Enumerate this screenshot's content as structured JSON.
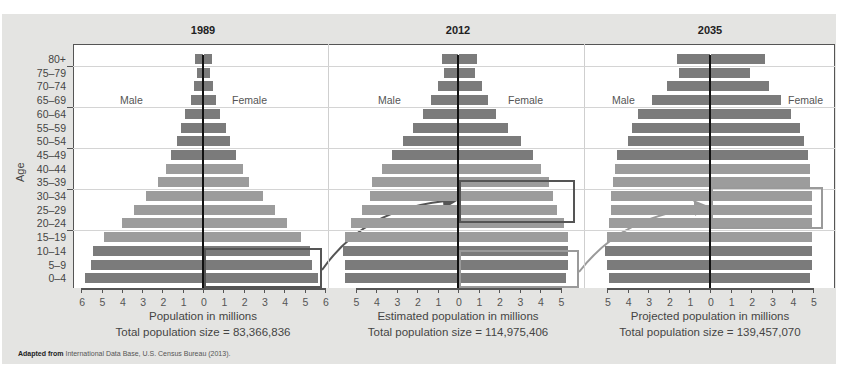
{
  "source": {
    "bold": "Adapted from",
    "text": " International Data Base, U.S. Census Bureau (2013)."
  },
  "y_axis_title": "Age",
  "age_groups": [
    "80+",
    "75–79",
    "70–74",
    "65–69",
    "60–64",
    "55–59",
    "50–54",
    "45–49",
    "40–44",
    "35–39",
    "30–34",
    "25–29",
    "20–24",
    "15–19",
    "10–14",
    "5–9",
    "0–4"
  ],
  "chart_data": [
    {
      "type": "bar",
      "subtype": "population-pyramid",
      "title": "1989",
      "xlabel": "Population in millions",
      "caption": "Total population size = 83,366,836",
      "male_label": "Male",
      "female_label": "Female",
      "ylabel": "Age",
      "xticks": [
        6,
        5,
        4,
        3,
        2,
        1,
        0,
        1,
        2,
        3,
        4,
        5,
        6
      ],
      "xlim": [
        -6,
        6
      ],
      "categories": [
        "80+",
        "75–79",
        "70–74",
        "65–69",
        "60–64",
        "55–59",
        "50–54",
        "45–49",
        "40–44",
        "35–39",
        "30–34",
        "25–29",
        "20–24",
        "15–19",
        "10–14",
        "5–9",
        "0–4"
      ],
      "series": [
        {
          "name": "Male",
          "values": [
            0.4,
            0.3,
            0.45,
            0.6,
            0.9,
            1.1,
            1.3,
            1.6,
            1.8,
            2.2,
            2.8,
            3.4,
            4.0,
            4.9,
            5.4,
            5.5,
            5.8
          ]
        },
        {
          "name": "Female",
          "values": [
            0.4,
            0.3,
            0.45,
            0.6,
            0.8,
            1.1,
            1.3,
            1.6,
            1.9,
            2.2,
            2.9,
            3.5,
            4.1,
            4.8,
            5.2,
            5.3,
            5.6
          ]
        }
      ],
      "shade": [
        "dark",
        "dark",
        "dark",
        "dark",
        "dark",
        "dark",
        "dark",
        "dark",
        "light",
        "light",
        "light",
        "light",
        "light",
        "light",
        "dark",
        "dark",
        "dark"
      ],
      "highlight_box": {
        "ages": [
          "10–14",
          "5–9",
          "0–4"
        ],
        "side": "female"
      }
    },
    {
      "type": "bar",
      "subtype": "population-pyramid",
      "title": "2012",
      "xlabel": "Estimated population in millions",
      "caption": "Total population size = 114,975,406",
      "male_label": "Male",
      "female_label": "Female",
      "ylabel": "Age",
      "xticks": [
        5,
        4,
        3,
        2,
        1,
        0,
        1,
        2,
        3,
        4,
        5
      ],
      "xlim": [
        -5.5,
        5.5
      ],
      "categories": [
        "80+",
        "75–79",
        "70–74",
        "65–69",
        "60–64",
        "55–59",
        "50–54",
        "45–49",
        "40–44",
        "35–39",
        "30–34",
        "25–29",
        "20–24",
        "15–19",
        "10–14",
        "5–9",
        "0–4"
      ],
      "series": [
        {
          "name": "Male",
          "values": [
            0.8,
            0.7,
            1.0,
            1.3,
            1.7,
            2.2,
            2.7,
            3.2,
            3.7,
            4.2,
            4.3,
            4.7,
            5.2,
            5.5,
            5.6,
            5.5,
            5.5
          ]
        },
        {
          "name": "Female",
          "values": [
            0.9,
            0.8,
            1.1,
            1.4,
            1.8,
            2.4,
            3.0,
            3.6,
            4.0,
            4.4,
            4.6,
            4.8,
            5.1,
            5.3,
            5.3,
            5.3,
            5.2
          ]
        }
      ],
      "shade": [
        "dark",
        "dark",
        "dark",
        "dark",
        "dark",
        "dark",
        "dark",
        "dark",
        "light",
        "light",
        "light",
        "light",
        "light",
        "light",
        "dark",
        "dark",
        "dark"
      ],
      "highlight_box": {
        "ages": [
          "35–39",
          "30–34",
          "25–29"
        ],
        "side": "female",
        "arrow_from": "1989 ages 0–14"
      },
      "secondary_box": {
        "ages": [
          "10–14",
          "5–9",
          "0–4"
        ],
        "side": "female"
      }
    },
    {
      "type": "bar",
      "subtype": "population-pyramid",
      "title": "2035",
      "xlabel": "Projected population in millions",
      "caption": "Total population size = 139,457,070",
      "male_label": "Male",
      "female_label": "Female",
      "ylabel": "Age",
      "xticks": [
        5,
        4,
        3,
        2,
        1,
        0,
        1,
        2,
        3,
        4,
        5
      ],
      "xlim": [
        -5.5,
        5.5
      ],
      "categories": [
        "80+",
        "75–79",
        "70–74",
        "65–69",
        "60–64",
        "55–59",
        "50–54",
        "45–49",
        "40–44",
        "35–39",
        "30–34",
        "25–29",
        "20–24",
        "15–19",
        "10–14",
        "5–9",
        "0–4"
      ],
      "series": [
        {
          "name": "Male",
          "values": [
            1.6,
            1.5,
            2.1,
            2.8,
            3.5,
            3.8,
            4.0,
            4.5,
            4.6,
            4.7,
            4.8,
            4.8,
            4.9,
            5.0,
            5.1,
            5.0,
            4.9
          ]
        },
        {
          "name": "Female",
          "values": [
            2.6,
            1.9,
            2.8,
            3.4,
            3.9,
            4.3,
            4.5,
            4.7,
            4.8,
            4.8,
            4.9,
            4.9,
            4.9,
            4.9,
            4.9,
            4.9,
            4.8
          ]
        }
      ],
      "shade": [
        "dark",
        "dark",
        "dark",
        "dark",
        "dark",
        "dark",
        "dark",
        "dark",
        "light",
        "light",
        "light",
        "light",
        "light",
        "light",
        "dark",
        "dark",
        "dark"
      ],
      "highlight_box": {
        "ages": [
          "35–39",
          "30–34",
          "25–29"
        ],
        "side": "female",
        "arrow_from": "2012 ages 0–14",
        "style": "light"
      }
    }
  ]
}
